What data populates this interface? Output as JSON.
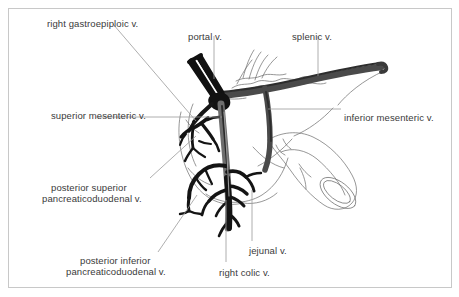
{
  "figure": {
    "background_color": "#ffffff",
    "frame_color": "#c8c8c8",
    "vessel_dark_color": "#1a1a1a",
    "vessel_gray_color": "#6e6e6e",
    "outline_color": "#555555",
    "leader_color": "#9a9a9a",
    "text_color": "#3a3a3a"
  },
  "labels": [
    {
      "id": "right-gastroepiploic",
      "text": "right gastroepiploic v.",
      "x": 47,
      "y": 18,
      "align": "left"
    },
    {
      "id": "portal",
      "text": "portal v.",
      "x": 188,
      "y": 31,
      "align": "left"
    },
    {
      "id": "splenic",
      "text": "splenic v.",
      "x": 292,
      "y": 31,
      "align": "left"
    },
    {
      "id": "superior-mesenteric",
      "text": "superior mesenteric v.",
      "x": 51,
      "y": 110,
      "align": "left"
    },
    {
      "id": "inferior-mesenteric",
      "text": "inferior mesenteric v.",
      "x": 344,
      "y": 112,
      "align": "left"
    },
    {
      "id": "posterior-superior-pancreaticoduodenal-line1",
      "text": "posterior superior",
      "x": 51,
      "y": 182,
      "align": "left"
    },
    {
      "id": "posterior-superior-pancreaticoduodenal-line2",
      "text": "pancreaticoduodenal v.",
      "x": 42,
      "y": 193,
      "align": "left"
    },
    {
      "id": "posterior-inferior-pancreaticoduodenal-line1",
      "text": "posterior inferior",
      "x": 80,
      "y": 255,
      "align": "left"
    },
    {
      "id": "posterior-inferior-pancreaticoduodenal-line2",
      "text": "pancreaticoduodenal v.",
      "x": 66,
      "y": 266,
      "align": "left"
    },
    {
      "id": "jejunal",
      "text": "jejunal v.",
      "x": 249,
      "y": 245,
      "align": "left"
    },
    {
      "id": "right-colic",
      "text": "right colic v.",
      "x": 219,
      "y": 267,
      "align": "left"
    }
  ]
}
